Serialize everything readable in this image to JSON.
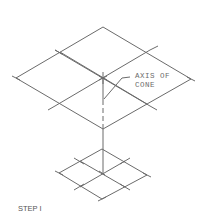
{
  "diagram": {
    "annotation": {
      "line1": "AXIS OF",
      "line2": "CONE"
    },
    "step_label": "STEP I",
    "line_color": "#6b6b6b",
    "upper_grid": {
      "top": [
        103,
        27
      ],
      "left": [
        16,
        78
      ],
      "right": [
        191,
        79
      ],
      "bottom": [
        103,
        129
      ],
      "center": [
        103,
        78
      ]
    },
    "lower_grid": {
      "top": [
        102,
        149
      ],
      "left": [
        59,
        173
      ],
      "right": [
        147,
        175
      ],
      "bottom": [
        102,
        199
      ],
      "center": [
        102,
        173
      ]
    }
  }
}
